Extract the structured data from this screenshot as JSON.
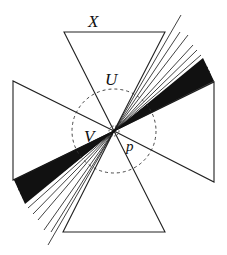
{
  "diagram": {
    "center": [
      114,
      131
    ],
    "labels": {
      "x": "X",
      "u": "U",
      "v": "V",
      "p": "p"
    },
    "triangles": {
      "top": [
        [
          64,
          32
        ],
        [
          165,
          32
        ],
        [
          114,
          131
        ]
      ],
      "bottom": [
        [
          63,
          232
        ],
        [
          165,
          232
        ],
        [
          114,
          131
        ]
      ],
      "left": [
        [
          13,
          81
        ],
        [
          13,
          180
        ],
        [
          114,
          131
        ]
      ],
      "right": [
        [
          214,
          82
        ],
        [
          214,
          182
        ],
        [
          114,
          131
        ]
      ]
    },
    "circles": {
      "outer_radius": 42,
      "inner_radius": 5
    },
    "fan": {
      "upper_right_endpoints": [
        [
          181,
          15
        ],
        [
          180,
          32
        ],
        [
          188,
          35
        ],
        [
          193,
          45
        ],
        [
          197,
          50
        ],
        [
          201,
          55
        ],
        [
          204,
          60
        ],
        [
          206,
          64
        ],
        [
          208,
          67
        ],
        [
          210,
          71
        ],
        [
          211,
          74
        ],
        [
          212,
          77
        ],
        [
          213,
          79
        ],
        [
          214,
          81
        ]
      ],
      "lower_left_endpoints": [
        [
          48,
          245
        ],
        [
          51,
          232
        ],
        [
          44,
          230
        ],
        [
          38,
          220
        ],
        [
          33,
          214
        ],
        [
          28,
          208
        ],
        [
          25,
          202
        ],
        [
          22,
          198
        ],
        [
          20,
          194
        ],
        [
          18,
          190
        ],
        [
          17,
          187
        ],
        [
          16,
          184
        ],
        [
          15,
          182
        ],
        [
          14,
          180
        ]
      ]
    }
  }
}
